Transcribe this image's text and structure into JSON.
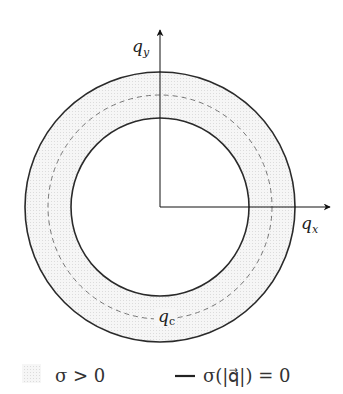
{
  "diagram": {
    "axes": {
      "x_label": "q",
      "x_sub": "x",
      "y_label": "q",
      "y_sub": "y"
    },
    "circles": {
      "center": [
        160,
        207
      ],
      "outer_radius": 135,
      "critical_radius": 112,
      "inner_radius": 89,
      "critical_label": "q",
      "critical_sub": "c"
    },
    "legend": [
      {
        "swatch": "shaded-region",
        "text": "σ > 0"
      },
      {
        "swatch": "solid-line",
        "text": "σ(|q⃗|) = 0"
      }
    ],
    "colors": {
      "line": "#2a2a2a",
      "shade": "#ececec",
      "dash": "#777777"
    }
  }
}
